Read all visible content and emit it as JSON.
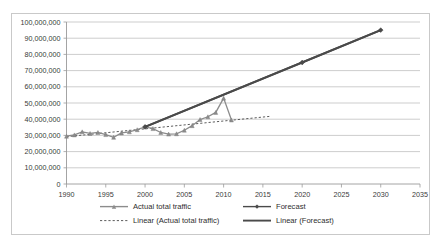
{
  "chart_data": {
    "type": "line",
    "title": "",
    "xlabel": "",
    "ylabel": "",
    "xlim": [
      1990,
      2035
    ],
    "ylim": [
      0,
      100000000
    ],
    "grid": true,
    "legend_position": "bottom",
    "x_ticks": [
      "1990",
      "1995",
      "2000",
      "2005",
      "2010",
      "2015",
      "2020",
      "2025",
      "2030",
      "2035"
    ],
    "y_ticks": [
      "0",
      "10,000,000",
      "20,000,000",
      "30,000,000",
      "40,000,000",
      "50,000,000",
      "60,000,000",
      "70,000,000",
      "80,000,000",
      "90,000,000",
      "100,000,000"
    ],
    "series": [
      {
        "name": "Actual total traffic",
        "style": "line-with-markers",
        "color": "#8c8c8c",
        "x": [
          1990,
          1991,
          1992,
          1993,
          1994,
          1995,
          1996,
          1997,
          1998,
          1999,
          2000,
          2001,
          2002,
          2003,
          2004,
          2005,
          2006,
          2007,
          2008,
          2009,
          2010,
          2011
        ],
        "values": [
          29500000,
          30300000,
          32200000,
          31200000,
          31800000,
          30500000,
          28800000,
          31500000,
          32200000,
          33500000,
          35300000,
          34200000,
          31800000,
          30800000,
          31000000,
          33200000,
          36000000,
          39800000,
          41500000,
          44200000,
          53000000,
          39500000
        ]
      },
      {
        "name": "Forecast",
        "style": "line-with-markers",
        "color": "#4a4a4a",
        "x": [
          2000,
          2020,
          2030
        ],
        "values": [
          35300000,
          75000000,
          95000000
        ]
      },
      {
        "name": "Linear (Actual total traffic)",
        "style": "dotted-trendline",
        "color": "#4a4a4a",
        "x": [
          1990,
          2016
        ],
        "values": [
          29200000,
          41800000
        ]
      },
      {
        "name": "Linear (Forecast)",
        "style": "solid-trendline",
        "color": "#4a4a4a",
        "x": [
          2000,
          2030
        ],
        "values": [
          35300000,
          95000000
        ]
      }
    ],
    "legend": [
      {
        "label": "Actual total traffic",
        "marker": "line-marker",
        "color": "#8c8c8c"
      },
      {
        "label": "Forecast",
        "marker": "line-marker",
        "color": "#4a4a4a"
      },
      {
        "label": "Linear (Actual total traffic)",
        "marker": "dotted-line",
        "color": "#4a4a4a"
      },
      {
        "label": "Linear (Forecast)",
        "marker": "solid-line",
        "color": "#4a4a4a"
      }
    ]
  }
}
